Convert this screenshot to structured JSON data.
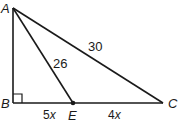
{
  "diagram": {
    "type": "geometry-triangle",
    "vertices": {
      "A": {
        "label": "A"
      },
      "B": {
        "label": "B"
      },
      "C": {
        "label": "C"
      },
      "E": {
        "label": "E"
      }
    },
    "segments": {
      "AC": {
        "label": "30"
      },
      "AE": {
        "label": "26"
      },
      "BE": {
        "label_coef": "5",
        "label_var": "x"
      },
      "EC": {
        "label_coef": "4",
        "label_var": "x"
      }
    },
    "right_angle_at": "B",
    "colors": {
      "stroke": "#1a1a1a",
      "background": "#ffffff"
    }
  }
}
